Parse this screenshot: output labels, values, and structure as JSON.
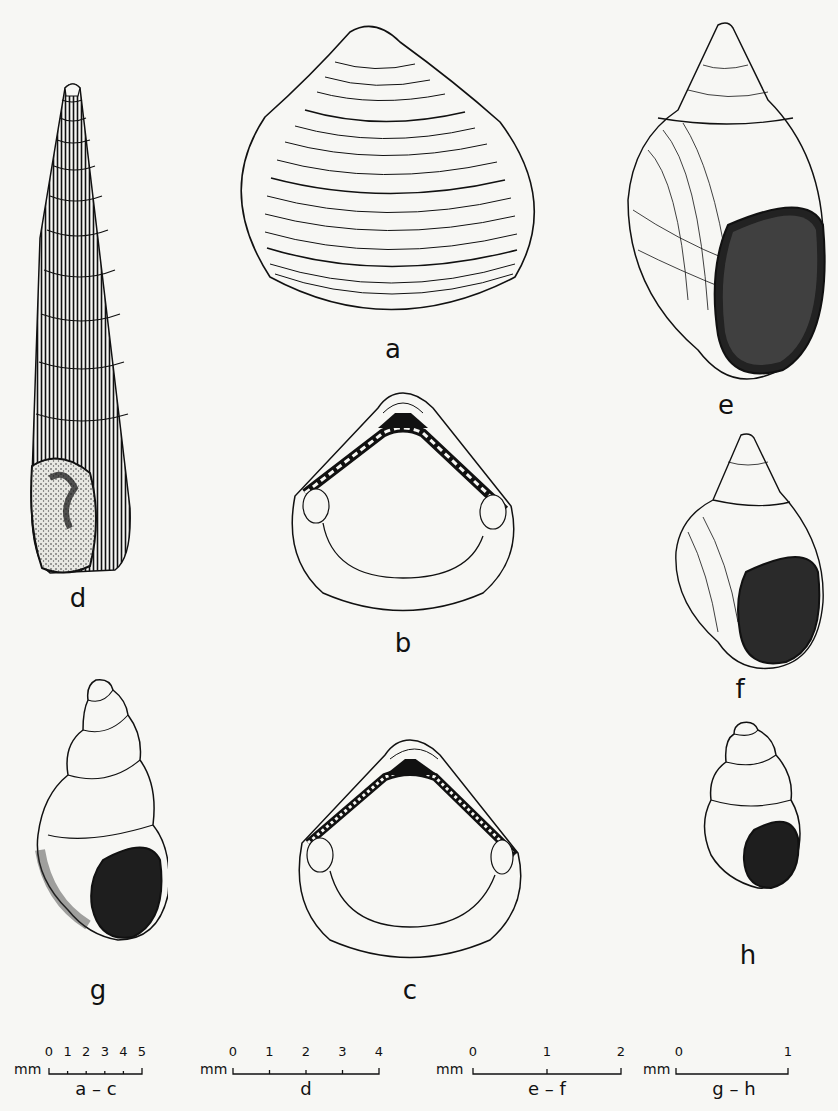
{
  "plate": {
    "figures": [
      {
        "id": "a",
        "label": "a",
        "kind": "bivalve shell, external view"
      },
      {
        "id": "b",
        "label": "b",
        "kind": "bivalve shell, internal view"
      },
      {
        "id": "c",
        "label": "c",
        "kind": "bivalve shell, internal view"
      },
      {
        "id": "d",
        "label": "d",
        "kind": "elongate spired gastropod shell"
      },
      {
        "id": "e",
        "label": "e",
        "kind": "gastropod shell, aperture view"
      },
      {
        "id": "f",
        "label": "f",
        "kind": "gastropod shell, aperture view"
      },
      {
        "id": "g",
        "label": "g",
        "kind": "small gastropod shell"
      },
      {
        "id": "h",
        "label": "h",
        "kind": "small gastropod shell"
      }
    ]
  },
  "scales": [
    {
      "unit": "mm",
      "ticks": [
        "0",
        "1",
        "2",
        "3",
        "4",
        "5"
      ],
      "caption": "a – c"
    },
    {
      "unit": "mm",
      "ticks": [
        "0",
        "1",
        "2",
        "3",
        "4"
      ],
      "caption": "d"
    },
    {
      "unit": "mm",
      "ticks": [
        "0",
        "1",
        "2"
      ],
      "caption": "e – f"
    },
    {
      "unit": "mm",
      "ticks": [
        "0",
        "1"
      ],
      "caption": "g – h"
    }
  ],
  "colors": {
    "ink": "#111111",
    "paper": "#f7f7f4"
  }
}
